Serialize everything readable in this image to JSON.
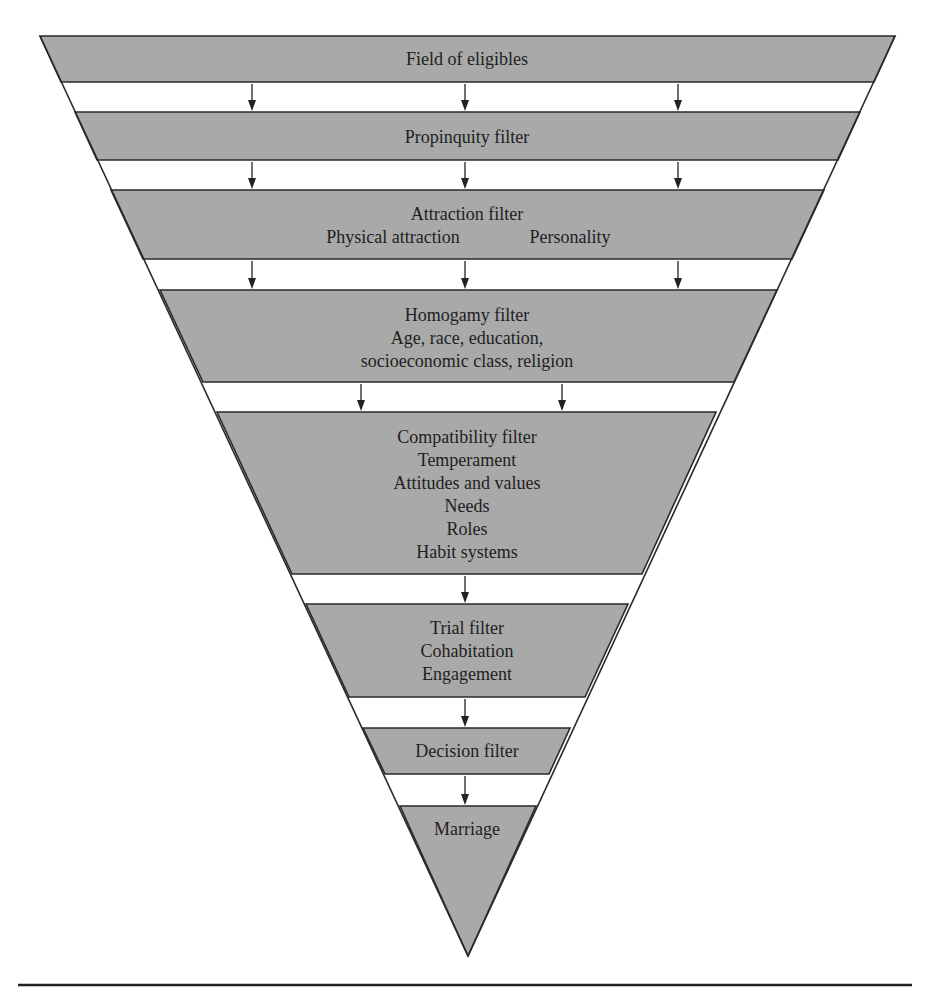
{
  "diagram": {
    "type": "filter-funnel",
    "fill_color": "#a9a9a9",
    "stroke_color": "#2a2a2a",
    "stages": [
      {
        "id": "field",
        "title": "Field of eligibles",
        "lines": []
      },
      {
        "id": "propinquity",
        "title": "Propinquity filter",
        "lines": []
      },
      {
        "id": "attraction",
        "title": "Attraction filter",
        "inline_items": [
          "Physical attraction",
          "Personality"
        ]
      },
      {
        "id": "homogamy",
        "title": "Homogamy filter",
        "lines": [
          "Age, race, education,",
          "socioeconomic class, religion"
        ]
      },
      {
        "id": "compatibility",
        "title": "Compatibility filter",
        "lines": [
          "Temperament",
          "Attitudes and values",
          "Needs",
          "Roles",
          "Habit systems"
        ]
      },
      {
        "id": "trial",
        "title": "Trial filter",
        "lines": [
          "Cohabitation",
          "Engagement"
        ]
      },
      {
        "id": "decision",
        "title": "Decision filter",
        "lines": []
      },
      {
        "id": "marriage",
        "title": "Marriage",
        "lines": []
      }
    ],
    "arrows_between_stages": [
      3,
      3,
      3,
      2,
      1,
      1,
      1
    ]
  }
}
